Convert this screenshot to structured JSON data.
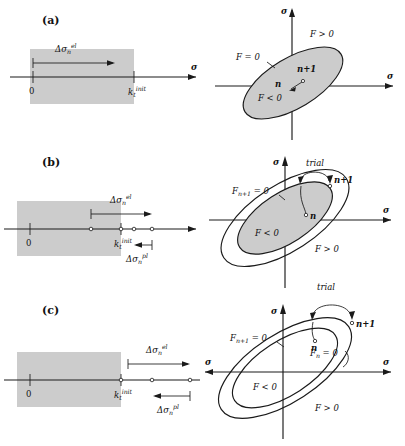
{
  "figure": {
    "shade_color": "#cccccc",
    "line_color": "#1a1a1a"
  },
  "symbols": {
    "sigma": "σ",
    "delta": "Δ",
    "origin": "0",
    "k_init": "k",
    "k_sub": "t",
    "k_sup": "init",
    "d_sigma": "Δσ",
    "sub_n": "n",
    "sup_el": "el",
    "sup_pl": "pl",
    "trial": "trial",
    "state_n": "n",
    "state_np1": "n+1",
    "F_eq0": "F = 0",
    "F_lt0": "F < 0",
    "F_gt0": "F > 0",
    "Fn_eq0": "F",
    "Fn_sub": "n",
    "Fn_rest": " = 0",
    "Fnp1_eq0": "F",
    "Fnp1_sub": "n+1",
    "Fnp1_rest": " = 0"
  },
  "panels": [
    {
      "id": "a",
      "label": "(a)",
      "left": {
        "axis_label": "σ",
        "origin_label": "0",
        "limit_label_base": "k",
        "limit_label_sub": "t",
        "limit_label_sup": "init",
        "arrows": [
          {
            "name": "elastic-increment",
            "label_base": "Δσ",
            "label_sub": "n",
            "label_sup": "el",
            "direction": "right",
            "ends_inside_elastic_domain": true
          }
        ],
        "shaded_domain": "elastic range 0 to k_t^init"
      },
      "right": {
        "v_axis_label": "σ",
        "h_axis_label": "σ",
        "surfaces": [
          {
            "name": "yield-surface",
            "label": "F = 0",
            "filled": true
          }
        ],
        "region_inside": "F < 0",
        "region_outside": "F > 0",
        "states": [
          "n",
          "n+1"
        ],
        "trial_label": null
      }
    },
    {
      "id": "b",
      "label": "(b)",
      "left": {
        "axis_label": "σ",
        "origin_label": "0",
        "limit_label_base": "k",
        "limit_label_sub": "t",
        "limit_label_sup": "init",
        "arrows": [
          {
            "name": "elastic-increment",
            "label_base": "Δσ",
            "label_sub": "n",
            "label_sup": "el",
            "direction": "right",
            "ends_inside_elastic_domain": false
          },
          {
            "name": "plastic-correction",
            "label_base": "Δσ",
            "label_sub": "n",
            "label_sup": "pl",
            "direction": "left",
            "ends_inside_elastic_domain": false
          }
        ],
        "shaded_domain": "elastic range 0 to k_t^init"
      },
      "right": {
        "v_axis_label": "σ",
        "h_axis_label": "σ",
        "surfaces": [
          {
            "name": "updated-yield-surface",
            "label_base": "F",
            "label_sub": "n+1",
            "label_rest": " = 0",
            "filled": false
          },
          {
            "name": "current-yield-surface",
            "label": null,
            "filled": true
          }
        ],
        "region_inside": "F < 0",
        "region_outside": "F > 0",
        "states": [
          "n",
          "n+1"
        ],
        "trial_label": "trial"
      }
    },
    {
      "id": "c",
      "label": "(c)",
      "left": {
        "axis_label": "σ",
        "origin_label": "0",
        "limit_label_base": "k",
        "limit_label_sub": "t",
        "limit_label_sup": "init",
        "arrows": [
          {
            "name": "elastic-increment",
            "label_base": "Δσ",
            "label_sub": "n",
            "label_sup": "el",
            "direction": "right",
            "ends_inside_elastic_domain": false
          },
          {
            "name": "plastic-correction",
            "label_base": "Δσ",
            "label_sub": "n",
            "label_sup": "pl",
            "direction": "left",
            "ends_inside_elastic_domain": false
          }
        ],
        "shaded_domain": "elastic range 0 to k_t^init"
      },
      "right": {
        "v_axis_label": "σ",
        "h_axis_label": "σ",
        "surfaces": [
          {
            "name": "updated-yield-surface",
            "label_base": "F",
            "label_sub": "n+1",
            "label_rest": " = 0",
            "filled": false
          },
          {
            "name": "current-yield-surface",
            "label_base": "F",
            "label_sub": "n",
            "label_rest": " = 0",
            "filled": false
          }
        ],
        "region_inside": "F < 0",
        "region_outside": "F > 0",
        "states": [
          "n",
          "n+1"
        ],
        "trial_label": "trial"
      }
    }
  ]
}
